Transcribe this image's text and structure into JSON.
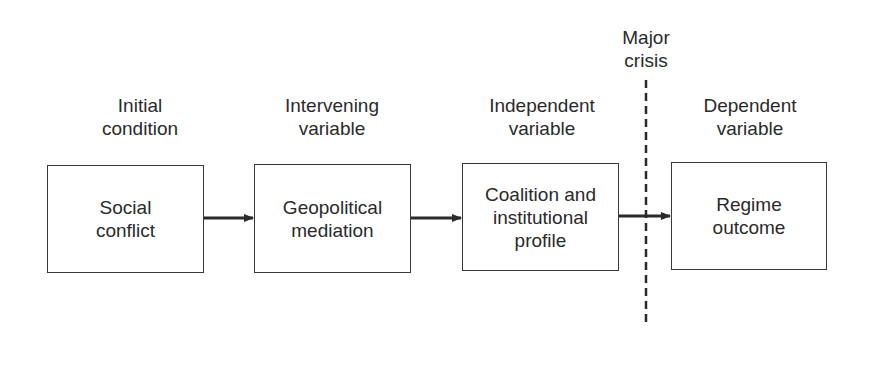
{
  "stages": [
    {
      "header": "Initial\ncondition",
      "box": "Social\nconflict"
    },
    {
      "header": "Intervening\nvariable",
      "box": "Geopolitical\nmediation"
    },
    {
      "header": "Independent\nvariable",
      "box": "Coalition and\ninstitutional\nprofile"
    },
    {
      "header": "Dependent\nvariable",
      "box": "Regime\noutcome"
    }
  ],
  "divider": {
    "label": "Major\ncrisis",
    "style": "dashed"
  },
  "colors": {
    "line": "#2a2a2a",
    "text": "#2a2a2a",
    "background": "#ffffff"
  }
}
